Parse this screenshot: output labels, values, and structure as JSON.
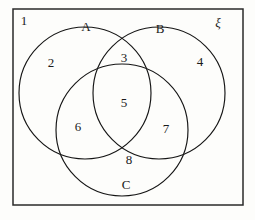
{
  "figure": {
    "type": "venn-diagram",
    "background_color": "#fdfdfb",
    "line_color": "#151515",
    "text_color": "#1a1a1a"
  },
  "universe": {
    "symbol": "ξ",
    "name": "universal-set",
    "rect": {
      "x": 13,
      "y": 9,
      "width": 230,
      "height": 196
    },
    "label_position": {
      "x": 218,
      "y": 24
    }
  },
  "sets": [
    {
      "name": "A",
      "label": "A",
      "circle": {
        "cx": 85,
        "cy": 93,
        "r": 66
      },
      "label_position": {
        "x": 86,
        "y": 28
      }
    },
    {
      "name": "B",
      "label": "B",
      "circle": {
        "cx": 159,
        "cy": 93,
        "r": 66
      },
      "label_position": {
        "x": 160,
        "y": 30
      }
    },
    {
      "name": "C",
      "label": "C",
      "circle": {
        "cx": 122,
        "cy": 130,
        "r": 66
      },
      "label_position": {
        "x": 126,
        "y": 186
      }
    }
  ],
  "regions": [
    {
      "label": "1",
      "region": "outside-all",
      "position": {
        "x": 24,
        "y": 22
      }
    },
    {
      "label": "2",
      "region": "A-only",
      "position": {
        "x": 51,
        "y": 64
      }
    },
    {
      "label": "3",
      "region": "A-and-B-only",
      "position": {
        "x": 124,
        "y": 59
      }
    },
    {
      "label": "4",
      "region": "B-only",
      "position": {
        "x": 200,
        "y": 63
      }
    },
    {
      "label": "5",
      "region": "A-and-B-and-C",
      "position": {
        "x": 124,
        "y": 104
      }
    },
    {
      "label": "6",
      "region": "A-and-C-only",
      "position": {
        "x": 78,
        "y": 128
      }
    },
    {
      "label": "7",
      "region": "B-and-C-only",
      "position": {
        "x": 166,
        "y": 130
      }
    },
    {
      "label": "8",
      "region": "C-only",
      "position": {
        "x": 129,
        "y": 161
      }
    }
  ]
}
